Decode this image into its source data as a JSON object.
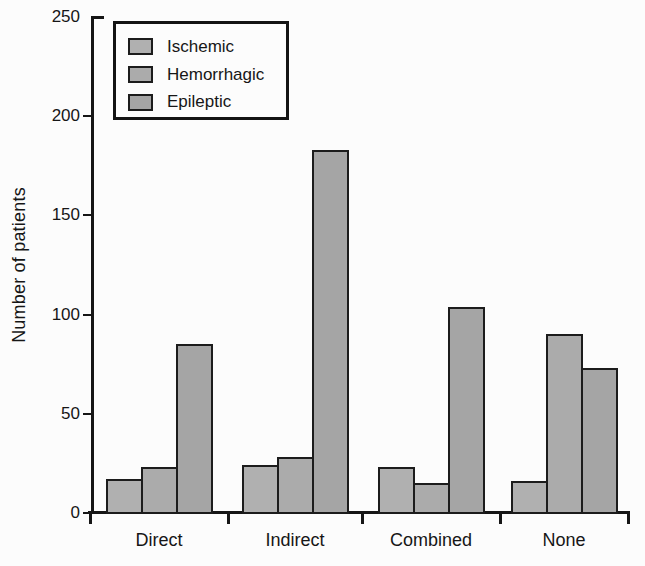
{
  "figure": {
    "background": "#fcfcfc",
    "text_color": "#161616",
    "axis_color": "#161616",
    "bar_border_color": "#1c1c1c"
  },
  "chart_data": {
    "type": "bar",
    "title": "",
    "categories": [
      "Direct",
      "Indirect",
      "Combined",
      "None"
    ],
    "series": [
      {
        "name": "Ischemic",
        "color": "#b0b0b0",
        "values": [
          17,
          24,
          23,
          16
        ]
      },
      {
        "name": "Hemorrhagic",
        "color": "#ababab",
        "values": [
          23,
          28,
          15,
          90
        ]
      },
      {
        "name": "Epileptic",
        "color": "#a5a5a5",
        "values": [
          85,
          183,
          104,
          73
        ]
      }
    ],
    "xlabel": "",
    "ylabel": "Number of patients",
    "ylim": [
      0,
      250
    ],
    "yticks": [
      0,
      50,
      100,
      150,
      200,
      250
    ],
    "grid": false,
    "legend_position": "top-left"
  }
}
